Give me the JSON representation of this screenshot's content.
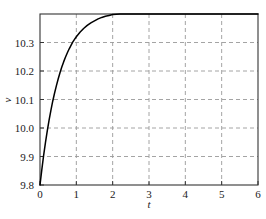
{
  "chart_data": {
    "type": "line",
    "title": "",
    "xlabel": "t",
    "ylabel": "v",
    "xlim": [
      0,
      6
    ],
    "ylim": [
      9.8,
      10.4
    ],
    "grid": true,
    "grid_style": "dashed",
    "legend": null,
    "xticks": [
      0,
      1,
      2,
      3,
      4,
      5,
      6
    ],
    "xtick_labels": [
      "0",
      "1",
      "2",
      "3",
      "4",
      "5",
      "6"
    ],
    "yticks": [
      9.8,
      9.9,
      10.0,
      10.1,
      10.2,
      10.3
    ],
    "ytick_labels": [
      "9.8",
      "9.9",
      "10.0",
      "10.1",
      "10.2",
      "10.3"
    ],
    "series": [
      {
        "name": "v(t)",
        "color": "#000000",
        "x": [
          0.0,
          0.05,
          0.1,
          0.15,
          0.2,
          0.25,
          0.3,
          0.35,
          0.4,
          0.45,
          0.5,
          0.55,
          0.6,
          0.65,
          0.7,
          0.75,
          0.8,
          0.85,
          0.9,
          0.95,
          1.0,
          1.1,
          1.2,
          1.3,
          1.4,
          1.5,
          1.6,
          1.7,
          1.8,
          1.9,
          2.0,
          2.2,
          2.4,
          2.6,
          2.8,
          3.0,
          3.25,
          3.5,
          3.75,
          4.0,
          4.5,
          5.0,
          5.5,
          6.0
        ],
        "y": [
          9.8,
          9.854,
          9.904,
          9.949,
          9.99,
          10.028,
          10.062,
          10.094,
          10.122,
          10.148,
          10.172,
          10.194,
          10.214,
          10.232,
          10.248,
          10.263,
          10.277,
          10.289,
          10.301,
          10.311,
          10.32,
          10.336,
          10.349,
          10.36,
          10.369,
          10.376,
          10.383,
          10.388,
          10.392,
          10.395,
          10.398,
          10.4,
          10.4,
          10.4,
          10.4,
          10.4,
          10.4,
          10.4,
          10.4,
          10.4,
          10.4,
          10.4,
          10.4,
          10.4
        ]
      }
    ],
    "asymptote": 10.4,
    "start_value": 9.8,
    "colors": {
      "curve": "#000000",
      "grid": "#9a9a9a",
      "frame": "#333333",
      "text": "#1a1a1a",
      "background": "#ffffff"
    }
  },
  "axes": {
    "x_title": "t",
    "y_title": "v"
  }
}
